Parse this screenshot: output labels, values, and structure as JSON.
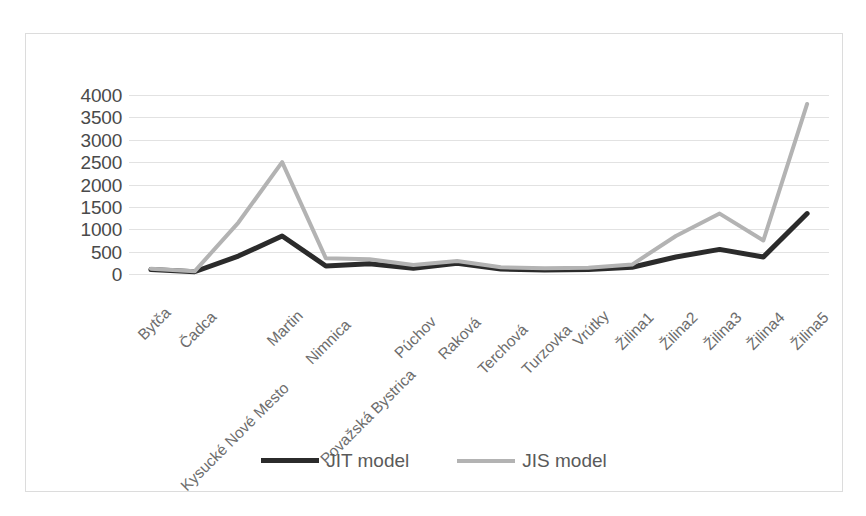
{
  "chart_data": {
    "type": "line",
    "title": "",
    "subtitle": "",
    "xlabel": "",
    "ylabel": "",
    "ylim": [
      0,
      4000
    ],
    "ytick_step": 500,
    "yticks": [
      "4000",
      "3500",
      "3000",
      "2500",
      "2000",
      "1500",
      "1000",
      "500",
      "0"
    ],
    "grid": true,
    "legend_position": "bottom-center",
    "categories": [
      "Bytča",
      "Čadca",
      "Kysucké Nové Mesto",
      "Martin",
      "Nimnica",
      "Považská Bystrica",
      "Púchov",
      "Raková",
      "Terchová",
      "Turzovka",
      "Vrútky",
      "Žilina1",
      "Žilina2",
      "Žilina3",
      "Žilina4",
      "Žilina5"
    ],
    "series": [
      {
        "name": "JIT model",
        "color": "#2b2b2b",
        "width": 5,
        "values": [
          100,
          50,
          400,
          850,
          180,
          230,
          130,
          240,
          110,
          90,
          100,
          150,
          380,
          550,
          380,
          1350
        ]
      },
      {
        "name": "JIS model",
        "color": "#b3b3b3",
        "width": 4,
        "values": [
          120,
          60,
          1150,
          2500,
          350,
          330,
          200,
          290,
          150,
          130,
          140,
          210,
          850,
          1350,
          750,
          3800
        ]
      }
    ]
  },
  "legend": {
    "items": [
      {
        "label": "JIT model",
        "color": "#2b2b2b",
        "width": 5
      },
      {
        "label": "JIS model",
        "color": "#b3b3b3",
        "width": 4
      }
    ]
  },
  "colors": {
    "border": "#dcdcdc",
    "gridline": "#e2e2e2",
    "tick_text": "#4a4a4a",
    "category_text": "#6d6d6d",
    "background": "#ffffff"
  }
}
